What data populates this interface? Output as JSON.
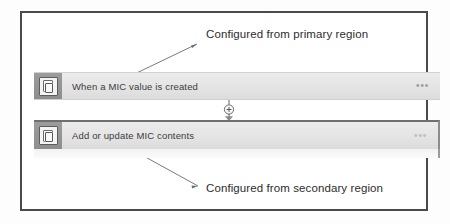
{
  "screenshot": {
    "width": 450,
    "height": 224,
    "frame_border_color": "#4a4a4a",
    "background": "#ffffff"
  },
  "flow": {
    "cards": [
      {
        "id": "trigger",
        "label": "When a MIC value is created",
        "icon": "document-pages-icon",
        "overflow_menu": "•••",
        "selected": false
      },
      {
        "id": "action",
        "label": "Add or update MIC contents",
        "icon": "document-pages-icon",
        "overflow_menu": "•••",
        "selected": true
      }
    ],
    "connector": {
      "icon": "insert-step-plus-icon",
      "symbol": "+",
      "arrow": "down-arrow-icon"
    }
  },
  "annotations": [
    {
      "id": "primary",
      "text": "Configured from primary region",
      "points_to": "trigger-card",
      "leader": "arrow-up-right"
    },
    {
      "id": "secondary",
      "text": "Configured from secondary region",
      "points_to": "action-card",
      "leader": "arrow-down-right"
    }
  ],
  "colors": {
    "card_fill": "#e6e6e6",
    "icon_chip": "#949494",
    "text": "#3b3b3b",
    "annotation_text": "#2d2d2d",
    "leader_line": "#777777",
    "selected_border": "#6f6f6f"
  }
}
